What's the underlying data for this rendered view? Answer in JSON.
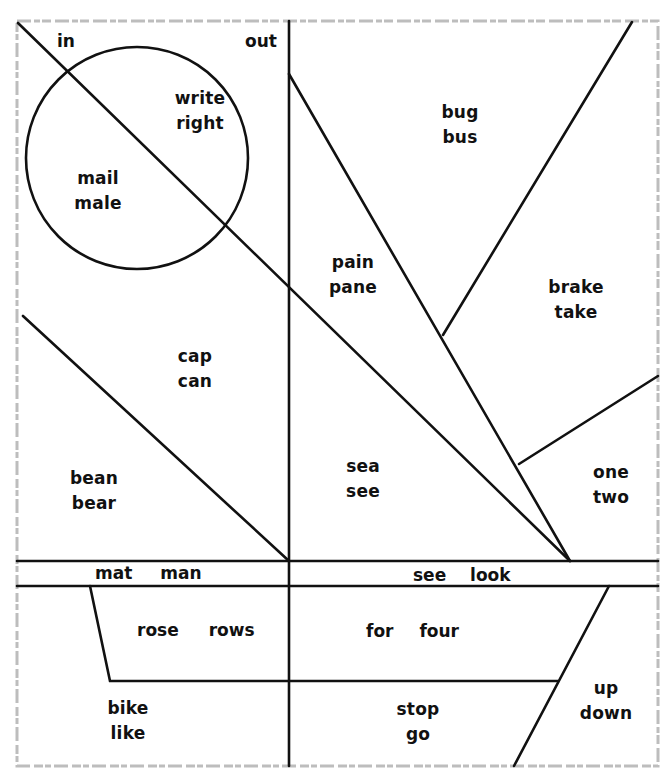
{
  "worksheet": {
    "colors": {
      "line": "#111111",
      "frame": "#bfbfbf",
      "background": "#ffffff"
    },
    "regions": [
      {
        "id": "in-label",
        "words": [
          "in"
        ]
      },
      {
        "id": "out-label",
        "words": [
          "out"
        ]
      },
      {
        "id": "write-right",
        "words": [
          "write",
          "right"
        ]
      },
      {
        "id": "mail-male",
        "words": [
          "mail",
          "male"
        ]
      },
      {
        "id": "bug-bus",
        "words": [
          "bug",
          "bus"
        ]
      },
      {
        "id": "pain-pane",
        "words": [
          "pain",
          "pane"
        ]
      },
      {
        "id": "brake-take",
        "words": [
          "brake",
          "take"
        ]
      },
      {
        "id": "cap-can",
        "words": [
          "cap",
          "can"
        ]
      },
      {
        "id": "bean-bear",
        "words": [
          "bean",
          "bear"
        ]
      },
      {
        "id": "sea-see",
        "words": [
          "sea",
          "see"
        ]
      },
      {
        "id": "one-two",
        "words": [
          "one",
          "two"
        ]
      },
      {
        "id": "mat-man",
        "words": [
          "mat",
          "man"
        ]
      },
      {
        "id": "see-look",
        "words": [
          "see",
          "look"
        ]
      },
      {
        "id": "rose-rows",
        "words": [
          "rose",
          "rows"
        ]
      },
      {
        "id": "for-four",
        "words": [
          "for",
          "four"
        ]
      },
      {
        "id": "bike-like",
        "words": [
          "bike",
          "like"
        ]
      },
      {
        "id": "stop-go",
        "words": [
          "stop",
          "go"
        ]
      },
      {
        "id": "up-down",
        "words": [
          "up",
          "down"
        ]
      }
    ]
  }
}
